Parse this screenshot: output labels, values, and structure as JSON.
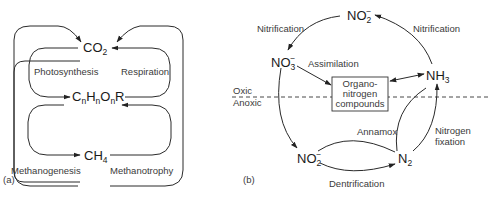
{
  "figure": {
    "panel_a": {
      "label": "(a)",
      "nodes": {
        "co2": {
          "base": "CO",
          "sub": "2"
        },
        "organic": {
          "c": "C",
          "h": "H",
          "o": "O",
          "r": "R",
          "sub": "n"
        },
        "ch4": {
          "base": "CH",
          "sub": "4"
        }
      },
      "processes": {
        "photosynthesis": "Photosynthesis",
        "respiration": "Respiration",
        "methanogenesis": "Methanogenesis",
        "methanotrophy": "Methanotrophy"
      }
    },
    "panel_b": {
      "label": "(b)",
      "nodes": {
        "no2_top": {
          "base": "NO",
          "sub": "2",
          "sup": "−"
        },
        "no3": {
          "base": "NO",
          "sub": "3",
          "sup": "−"
        },
        "nh3": {
          "base": "NH",
          "sub": "3"
        },
        "organo_box": [
          "Organo-",
          "nitrogen",
          "compounds"
        ],
        "no2_bottom": {
          "base": "NO",
          "sub": "2",
          "sup": "−"
        },
        "n2": {
          "base": "N",
          "sub": "2"
        }
      },
      "processes": {
        "nitrification_left": "Nitrification",
        "nitrification_right": "Nitrification",
        "assimilation": "Assimilation",
        "annamox": "Annamox",
        "nitrogen_fixation_1": "Nitrogen",
        "nitrogen_fixation_2": "fixation",
        "dentrification": "Dentrification"
      },
      "zones": {
        "oxic": "Oxic",
        "anoxic": "Anoxic"
      }
    }
  }
}
